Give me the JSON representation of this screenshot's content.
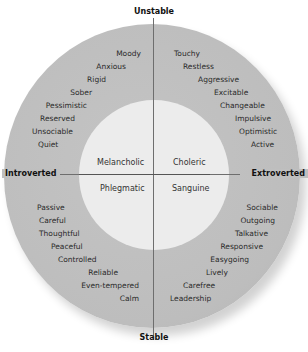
{
  "diagram": {
    "axes": {
      "top": "Unstable",
      "bottom": "Stable",
      "left": "Introverted",
      "right": "Extroverted"
    },
    "temperaments": {
      "top_left": "Melancholic",
      "top_right": "Choleric",
      "bottom_left": "Phlegmatic",
      "bottom_right": "Sanguine"
    },
    "traits": {
      "unstable_introverted": [
        "Moody",
        "Anxious",
        "Rigid",
        "Sober",
        "Pessimistic",
        "Reserved",
        "Unsociable",
        "Quiet"
      ],
      "unstable_extroverted": [
        "Touchy",
        "Restless",
        "Aggressive",
        "Excitable",
        "Changeable",
        "Impulsive",
        "Optimistic",
        "Active"
      ],
      "stable_introverted": [
        "Passive",
        "Careful",
        "Thoughtful",
        "Peaceful",
        "Controlled",
        "Reliable",
        "Even-tempered",
        "Calm"
      ],
      "stable_extroverted": [
        "Sociable",
        "Outgoing",
        "Talkative",
        "Responsive",
        "Easygoing",
        "Lively",
        "Carefree",
        "Leadership"
      ]
    },
    "colors": {
      "outer_ring": "#bfbfbf",
      "inner_circle": "#ececec",
      "axis_line": "#6e6e6e",
      "text": "#222222"
    }
  }
}
